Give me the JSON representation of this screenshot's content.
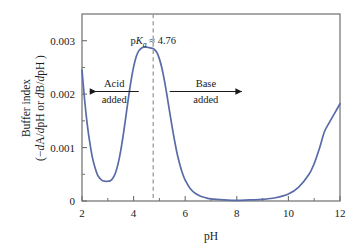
{
  "chart_data": {
    "type": "line",
    "title": "",
    "subtitle": "",
    "xlabel": "pH",
    "ylabel_line1": "Buffer index",
    "ylabel_line2": "(−dA/dpH or dB/dpH )",
    "xlim": [
      2,
      12
    ],
    "ylim": [
      0,
      0.0035
    ],
    "grid": false,
    "legend": null,
    "x_ticks_major": [
      "2",
      "4",
      "6",
      "8",
      "10",
      "12"
    ],
    "x_ticks_major_values": [
      2,
      4,
      6,
      8,
      10,
      12
    ],
    "x_ticks_minor_values": [
      3,
      5,
      7,
      9,
      11
    ],
    "y_ticks_major": [
      "0",
      "0.001",
      "0.002",
      "0.003"
    ],
    "y_ticks_major_values": [
      0,
      0.001,
      0.002,
      0.003
    ],
    "y_ticks_minor_values": [
      0.0005,
      0.0015,
      0.0025
    ],
    "series": [
      {
        "name": "Buffer index",
        "color": "#5a6ba8",
        "x": [
          2.0,
          2.1,
          2.2,
          2.3,
          2.4,
          2.5,
          2.6,
          2.7,
          2.8,
          2.9,
          3.0,
          3.1,
          3.2,
          3.3,
          3.4,
          3.5,
          3.6,
          3.7,
          3.8,
          3.9,
          4.0,
          4.1,
          4.2,
          4.3,
          4.4,
          4.5,
          4.6,
          4.7,
          4.76,
          4.8,
          4.9,
          5.0,
          5.1,
          5.2,
          5.3,
          5.4,
          5.5,
          5.6,
          5.7,
          5.8,
          5.9,
          6.0,
          6.2,
          6.4,
          6.6,
          6.8,
          7.0,
          7.5,
          8.0,
          8.5,
          9.0,
          9.5,
          10.0,
          10.4,
          10.8,
          11.0,
          11.2,
          11.4,
          11.6,
          11.8,
          12.0
        ],
        "y": [
          0.00245,
          0.0019,
          0.00145,
          0.0011,
          0.00082,
          0.00063,
          0.00049,
          0.00042,
          0.00038,
          0.00037,
          0.00037,
          0.00038,
          0.00043,
          0.00053,
          0.0007,
          0.00094,
          0.00124,
          0.00158,
          0.00193,
          0.00225,
          0.00251,
          0.0027,
          0.00281,
          0.00286,
          0.00288,
          0.00288,
          0.00287,
          0.00286,
          0.00285,
          0.00284,
          0.00278,
          0.00266,
          0.00248,
          0.00224,
          0.00196,
          0.00166,
          0.00137,
          0.0011,
          0.00086,
          0.00067,
          0.00051,
          0.00039,
          0.00023,
          0.00014,
          9e-05,
          6e-05,
          4e-05,
          2e-05,
          1e-05,
          2e-05,
          3e-05,
          6e-05,
          0.00013,
          0.00026,
          0.0005,
          0.0007,
          0.00098,
          0.0013,
          0.00148,
          0.00165,
          0.00182
        ]
      }
    ],
    "annotations": [
      {
        "id": "pka-label",
        "text_prefix": "p",
        "text_italic": "K",
        "text_sub": "a",
        "text_suffix": " ≈ 4.76",
        "x_value": 4.76,
        "marker": "dashed-vertical-line",
        "marker_color": "#9a9a9a"
      },
      {
        "id": "acid-added",
        "line1": "Acid",
        "line2": "added",
        "arrow": "left",
        "x_from": 4.2,
        "x_to": 2.3,
        "y_value": 0.00205
      },
      {
        "id": "base-added",
        "line1": "Base",
        "line2": "added",
        "arrow": "right",
        "x_from": 5.4,
        "x_to": 8.2,
        "y_value": 0.00205
      }
    ],
    "peak": {
      "x": 4.76,
      "y": 0.00288
    },
    "local_minimum": {
      "x": 3.05,
      "y": 0.00037
    },
    "frame_color": "#6e6e6e"
  }
}
